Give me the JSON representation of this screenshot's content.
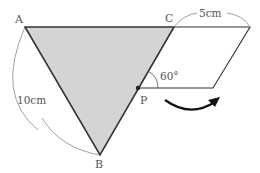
{
  "diagram": {
    "points": {
      "A": {
        "label": "A",
        "x": 25,
        "y": 27
      },
      "B": {
        "label": "B",
        "x": 100,
        "y": 155
      },
      "C": {
        "label": "C",
        "x": 174,
        "y": 27
      },
      "P": {
        "label": "P",
        "x": 138,
        "y": 88
      }
    },
    "parallelogram_corner_top_right": {
      "x": 250,
      "y": 27
    },
    "parallelogram_corner_bottom_right": {
      "x": 213,
      "y": 88
    },
    "measurements": {
      "side_AB": "10cm",
      "side_top": "5cm",
      "angle_at_P": "60°"
    },
    "colors": {
      "triangle_fill": "#d4d4d4",
      "stroke": "#333333",
      "label": "#555555"
    }
  }
}
